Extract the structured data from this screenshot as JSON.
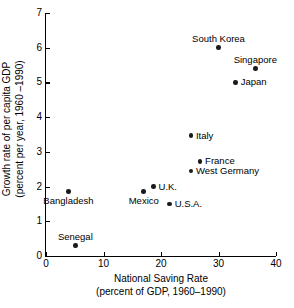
{
  "chart_data": {
    "type": "scatter",
    "title": "",
    "xlabel": "National Saving Rate",
    "xlabel_sub": "(percent of GDP, 1960–1990)",
    "ylabel": "Growth rate of per capita GDP",
    "ylabel_sub": "(percent per year, 1960 –1990)",
    "xlim": [
      0,
      40
    ],
    "ylim": [
      0,
      7
    ],
    "xticks": [
      0,
      10,
      20,
      30,
      40
    ],
    "yticks": [
      0,
      1,
      2,
      3,
      4,
      5,
      6,
      7
    ],
    "xtick_labels": [
      "0",
      "10",
      "20",
      "30",
      "40"
    ],
    "ytick_labels": [
      "0",
      "1",
      "2",
      "3",
      "4",
      "5",
      "6",
      "7"
    ],
    "grid": false,
    "legend": "none",
    "points": [
      {
        "label": "South Korea",
        "x": 30.0,
        "y": 6.0,
        "label_pos": "above"
      },
      {
        "label": "Singapore",
        "x": 36.4,
        "y": 5.4,
        "label_pos": "above"
      },
      {
        "label": "Japan",
        "x": 33.0,
        "y": 5.0,
        "label_pos": "right"
      },
      {
        "label": "Italy",
        "x": 25.2,
        "y": 3.47,
        "label_pos": "right"
      },
      {
        "label": "France",
        "x": 26.8,
        "y": 2.73,
        "label_pos": "right"
      },
      {
        "label": "West Germany",
        "x": 25.2,
        "y": 2.45,
        "label_pos": "right"
      },
      {
        "label": "U.K.",
        "x": 18.7,
        "y": 2.0,
        "label_pos": "right"
      },
      {
        "label": "Mexico",
        "x": 17.0,
        "y": 1.85,
        "label_pos": "below"
      },
      {
        "label": "U.S.A.",
        "x": 21.5,
        "y": 1.5,
        "label_pos": "right"
      },
      {
        "label": "Bangladesh",
        "x": 3.9,
        "y": 1.85,
        "label_pos": "below"
      },
      {
        "label": "Senegal",
        "x": 5.1,
        "y": 0.3,
        "label_pos": "above"
      }
    ]
  }
}
